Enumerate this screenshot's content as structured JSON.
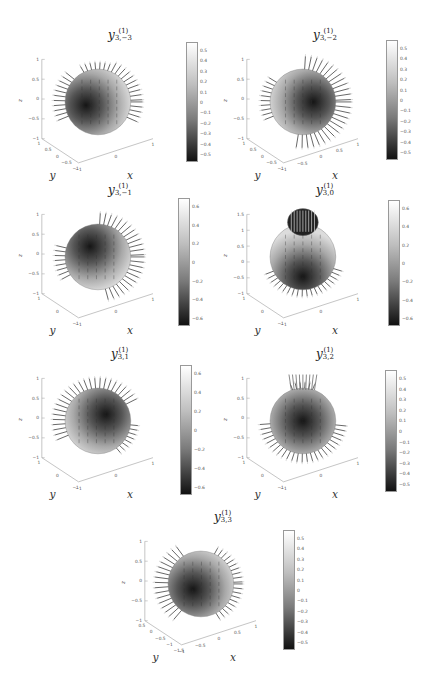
{
  "figure": {
    "panels": [
      {
        "id": "p1",
        "title_base": "y",
        "title_sup": "(1)",
        "title_sub": "3,−3",
        "cbar_ticks": [
          "0.5",
          "0.4",
          "0.3",
          "0.2",
          "0.1",
          "0",
          "−0.1",
          "−0.2",
          "−0.3",
          "−0.4",
          "−0.5"
        ],
        "z_ticks": [
          "1",
          "0.5",
          "0",
          "−0.5",
          "−1"
        ],
        "y_ticks": [
          "1",
          "0.5",
          "0",
          "−0.5",
          "−1"
        ],
        "x_ticks": [
          "−1",
          "0",
          "1"
        ]
      },
      {
        "id": "p2",
        "title_base": "y",
        "title_sup": "(1)",
        "title_sub": "3,−2",
        "cbar_ticks": [
          "0.5",
          "0.4",
          "0.3",
          "0.2",
          "0.1",
          "0",
          "−0.1",
          "−0.2",
          "−0.3",
          "−0.4",
          "−0.5"
        ],
        "z_ticks": [
          "1",
          "0.5",
          "0",
          "−0.5",
          "−1"
        ],
        "y_ticks": [
          "1",
          "0.5",
          "0",
          "−0.5",
          "−1"
        ],
        "x_ticks": [
          "−1",
          "−0.5",
          "0",
          "0.5",
          "1"
        ]
      },
      {
        "id": "p3",
        "title_base": "y",
        "title_sup": "(1)",
        "title_sub": "3,−1",
        "cbar_ticks": [
          "0.6",
          "0.4",
          "0.2",
          "0",
          "−0.2",
          "−0.4",
          "−0.6"
        ],
        "z_ticks": [
          "1",
          "0.5",
          "0",
          "−0.5",
          "−1"
        ],
        "y_ticks": [
          "1",
          "0",
          "−1"
        ],
        "x_ticks": [
          "−1",
          "0",
          "1"
        ]
      },
      {
        "id": "p4",
        "title_base": "y",
        "title_sup": "(1)",
        "title_sub": "3,0",
        "cbar_ticks": [
          "0.6",
          "0.4",
          "0.2",
          "0",
          "−0.2",
          "−0.4",
          "−0.6"
        ],
        "z_ticks": [
          "1.5",
          "1",
          "0.5",
          "0",
          "−0.5",
          "−1"
        ],
        "y_ticks": [
          "1",
          "0",
          "−1"
        ],
        "x_ticks": [
          "−1",
          "0",
          "1"
        ]
      },
      {
        "id": "p5",
        "title_base": "y",
        "title_sup": "(1)",
        "title_sub": "3,1",
        "cbar_ticks": [
          "0.6",
          "0.4",
          "0.2",
          "0",
          "−0.2",
          "−0.4",
          "−0.6"
        ],
        "z_ticks": [
          "1",
          "0.5",
          "0",
          "−0.5",
          "−1"
        ],
        "y_ticks": [
          "1",
          "0",
          "−1"
        ],
        "x_ticks": [
          "−1",
          "0",
          "1"
        ]
      },
      {
        "id": "p6",
        "title_base": "y",
        "title_sup": "(1)",
        "title_sub": "3,2",
        "cbar_ticks": [
          "0.5",
          "0.4",
          "0.3",
          "0.2",
          "0.1",
          "0",
          "−0.1",
          "−0.2",
          "−0.3",
          "−0.4",
          "−0.5"
        ],
        "z_ticks": [
          "1",
          "0.5",
          "0",
          "−0.5",
          "−1"
        ],
        "y_ticks": [
          "1",
          "0",
          "−1"
        ],
        "x_ticks": [
          "−1",
          "0",
          "1"
        ]
      },
      {
        "id": "p7",
        "title_base": "y",
        "title_sup": "(1)",
        "title_sub": "3,3",
        "cbar_ticks": [
          "0.5",
          "0.4",
          "0.3",
          "0.2",
          "0.1",
          "0",
          "−0.1",
          "−0.2",
          "−0.3",
          "−0.4",
          "−0.5"
        ],
        "z_ticks": [
          "1",
          "0.5",
          "0",
          "−0.5",
          "−1"
        ],
        "y_ticks": [
          "0.5",
          "0",
          "−0.5",
          "−1",
          "−1.5"
        ],
        "x_ticks": [
          "−1",
          "−0.5",
          "0",
          "0.5",
          "1"
        ]
      }
    ],
    "axis_labels": {
      "x": "x",
      "y": "y",
      "z": "z"
    }
  },
  "chart_data": [
    {
      "type": "surface3d",
      "title": "y^(1)_{3,-3}",
      "xlabel": "x",
      "ylabel": "y",
      "zlabel": "z",
      "zlim": [
        -1,
        1
      ],
      "colorbar_range": [
        -0.5,
        0.5
      ],
      "colormap": "gray",
      "grid": false
    },
    {
      "type": "surface3d",
      "title": "y^(1)_{3,-2}",
      "xlabel": "x",
      "ylabel": "y",
      "zlabel": "z",
      "zlim": [
        -1,
        1
      ],
      "colorbar_range": [
        -0.5,
        0.5
      ],
      "colormap": "gray",
      "grid": false
    },
    {
      "type": "surface3d",
      "title": "y^(1)_{3,-1}",
      "xlabel": "x",
      "ylabel": "y",
      "zlabel": "z",
      "zlim": [
        -1,
        1
      ],
      "colorbar_range": [
        -0.6,
        0.6
      ],
      "colormap": "gray",
      "grid": false
    },
    {
      "type": "surface3d",
      "title": "y^(1)_{3,0}",
      "xlabel": "x",
      "ylabel": "y",
      "zlabel": "z",
      "zlim": [
        -1,
        1.5
      ],
      "colorbar_range": [
        -0.7,
        0.7
      ],
      "colormap": "gray",
      "grid": false
    },
    {
      "type": "surface3d",
      "title": "y^(1)_{3,1}",
      "xlabel": "x",
      "ylabel": "y",
      "zlabel": "z",
      "zlim": [
        -1,
        1
      ],
      "colorbar_range": [
        -0.6,
        0.6
      ],
      "colormap": "gray",
      "grid": false
    },
    {
      "type": "surface3d",
      "title": "y^(1)_{3,2}",
      "xlabel": "x",
      "ylabel": "y",
      "zlabel": "z",
      "zlim": [
        -1,
        1
      ],
      "colorbar_range": [
        -0.55,
        0.55
      ],
      "colormap": "gray",
      "grid": false
    },
    {
      "type": "surface3d",
      "title": "y^(1)_{3,3}",
      "xlabel": "x",
      "ylabel": "y",
      "zlabel": "z",
      "zlim": [
        -1,
        1
      ],
      "colorbar_range": [
        -0.55,
        0.55
      ],
      "colormap": "gray",
      "grid": false
    }
  ]
}
